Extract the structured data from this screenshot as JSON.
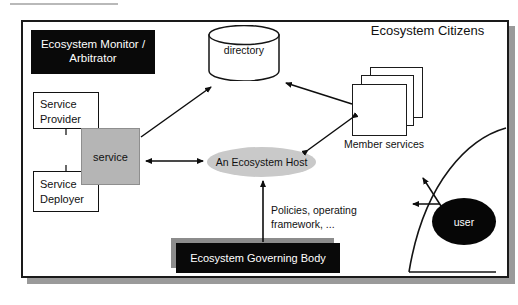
{
  "diagram": {
    "title": "Ecosystem Citizens",
    "nodes": {
      "monitor": "Ecosystem Monitor / Arbitrator",
      "service_provider": "Service\nProvider",
      "service_provider_line1": "Service",
      "service_provider_line2": "Provider",
      "service_deployer_line1": "Service",
      "service_deployer_line2": "Deployer",
      "service": "service",
      "directory": "directory",
      "host": "An Ecosystem Host",
      "member_services": "Member services",
      "user": "user",
      "governing_body": "Ecosystem Governing Body"
    },
    "edge_labels": {
      "policies_line1": "Policies, operating",
      "policies_line2": "framework, ..."
    },
    "colors": {
      "black_fill": "#090909",
      "gray_service": "#b5b5b5",
      "gray_host": "#c9c9c9",
      "shadow_gray": "#8c8c8c",
      "frame_shadow": "#9a9a9a",
      "outline": "#121212",
      "background": "#ffffff"
    }
  }
}
